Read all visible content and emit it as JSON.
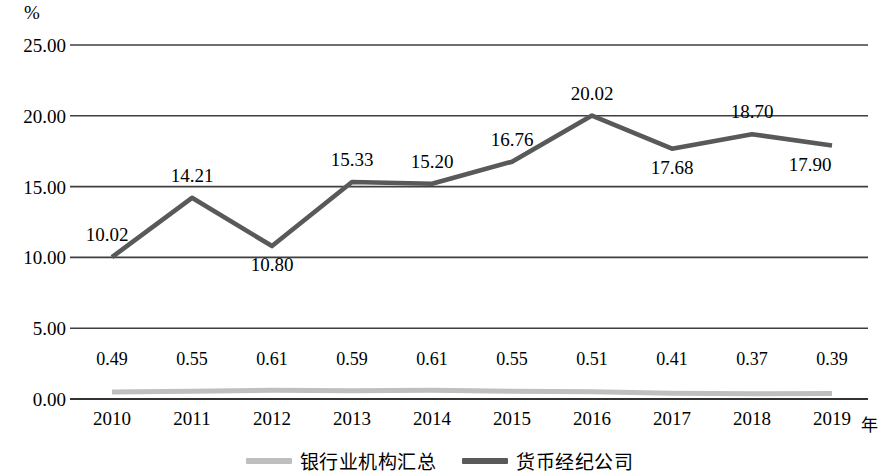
{
  "chart_data": {
    "type": "line",
    "title": "",
    "xlabel": "年",
    "ylabel": "%",
    "unit_label": "%",
    "categories": [
      "2010",
      "2011",
      "2012",
      "2013",
      "2014",
      "2015",
      "2016",
      "2017",
      "2018",
      "2019"
    ],
    "ylim": [
      0,
      25
    ],
    "ytick_labels": [
      "0.00",
      "5.00",
      "10.00",
      "15.00",
      "20.00",
      "25.00"
    ],
    "ytick_values": [
      0,
      5,
      10,
      15,
      20,
      25
    ],
    "grid": "horizontal",
    "legend_position": "bottom",
    "series": [
      {
        "name": "银行业机构汇总",
        "color": "#bfbfbf",
        "values": [
          0.49,
          0.55,
          0.61,
          0.59,
          0.61,
          0.55,
          0.51,
          0.41,
          0.37,
          0.39
        ],
        "labels": [
          "0.49",
          "0.55",
          "0.61",
          "0.59",
          "0.61",
          "0.55",
          "0.51",
          "0.41",
          "0.37",
          "0.39"
        ]
      },
      {
        "name": "货币经纪公司",
        "color": "#595959",
        "values": [
          10.02,
          14.21,
          10.8,
          15.33,
          15.2,
          16.76,
          20.02,
          17.68,
          18.7,
          17.9
        ],
        "labels": [
          "10.02",
          "14.21",
          "10.80",
          "15.33",
          "15.20",
          "16.76",
          "20.02",
          "17.68",
          "18.70",
          "17.90"
        ]
      }
    ]
  },
  "legend": {
    "items": [
      {
        "label": "银行业机构汇总",
        "color": "#bfbfbf"
      },
      {
        "label": "货币经纪公司",
        "color": "#595959"
      }
    ]
  },
  "axis": {
    "unit": "%",
    "x_unit_suffix": "年"
  }
}
